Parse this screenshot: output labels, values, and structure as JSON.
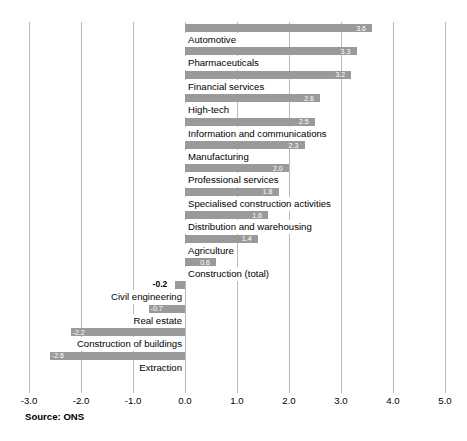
{
  "chart_data": {
    "type": "bar",
    "orientation": "horizontal",
    "title": "",
    "xlabel": "",
    "ylabel": "",
    "xlim": [
      -3.0,
      5.0
    ],
    "xtick_step": 1.0,
    "xticks": [
      "-3.0",
      "-2.0",
      "-1.0",
      "0.0",
      "1.0",
      "2.0",
      "3.0",
      "4.0",
      "5.0"
    ],
    "grid": "vertical",
    "legend": "none",
    "bar_color": "#9a9a9a",
    "categories": [
      "Automotive",
      "Pharmaceuticals",
      "Financial services",
      "High-tech",
      "Information and communications",
      "Manufacturing",
      "Professional services",
      "Specialised construction activities",
      "Distribution and warehousing",
      "Agriculture",
      "Construction (total)",
      "Civil engineering",
      "Real estate",
      "Construction of buildings",
      "Extraction"
    ],
    "values": [
      3.6,
      3.3,
      3.2,
      2.6,
      2.5,
      2.3,
      2.0,
      1.8,
      1.6,
      1.4,
      0.6,
      -0.2,
      -0.7,
      -2.2,
      -2.6
    ],
    "value_labels": [
      "3.6",
      "3.3",
      "3.2",
      "2.6",
      "2.5",
      "2.3",
      "2.0",
      "1.8",
      "1.6",
      "1.4",
      "0.6",
      "-0.2",
      "-0.7",
      "-2.2",
      "-2.6"
    ]
  },
  "source_note": "Source: ONS"
}
